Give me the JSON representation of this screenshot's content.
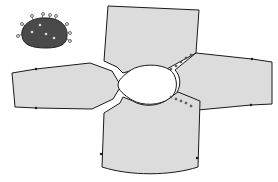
{
  "diagram": {
    "type": "sewing-pattern-layout",
    "colors": {
      "background": "#ffffff",
      "piece_fill": "#dcdcdc",
      "outline": "#1a1a1a",
      "swatch_fill": "#4a4a4a",
      "neck_hole": "#ffffff"
    },
    "pieces": [
      {
        "id": "front-body",
        "label": "Front body (top)"
      },
      {
        "id": "back-body",
        "label": "Back body (bottom)"
      },
      {
        "id": "left-sleeve",
        "label": "Left sleeve"
      },
      {
        "id": "right-sleeve",
        "label": "Right sleeve"
      },
      {
        "id": "neck-opening",
        "label": "Neck opening"
      }
    ],
    "swatch": {
      "id": "fabric-swatch",
      "label": "Fabric swatch with pins"
    }
  }
}
